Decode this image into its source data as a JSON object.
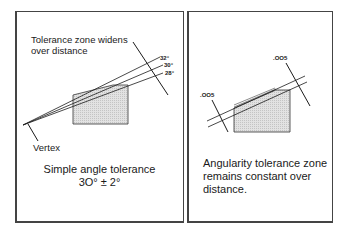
{
  "left_panel": {
    "annotation": "Tolerance zone widens",
    "annotation_line2": "over distance",
    "angle_labels": [
      "32°",
      "30°",
      "28°"
    ],
    "vertex_label": "Vertex",
    "caption_line1": "Simple angle tolerance",
    "caption_line2": "3O° ± 2°"
  },
  "right_panel": {
    "tolerance_label_left": ".OO5",
    "tolerance_label_right": ".OO5",
    "caption_line1": "Angularity tolerance  zone",
    "caption_line2": "remains constant over",
    "caption_line3": "distance."
  },
  "colors": {
    "border": "#444444",
    "line": "#1a1a1a",
    "block_fill": "#d9d9d9"
  }
}
